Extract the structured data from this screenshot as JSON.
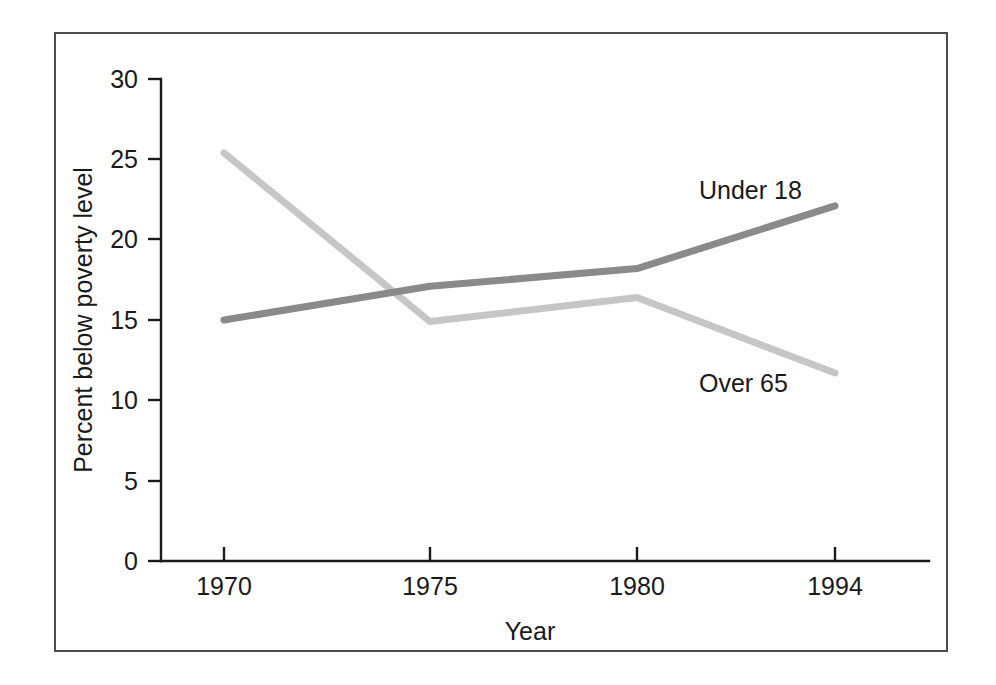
{
  "chart_data": {
    "type": "line",
    "title": "",
    "xlabel": "Year",
    "ylabel": "Percent below poverty level",
    "categories": [
      "1970",
      "1975",
      "1980",
      "1994"
    ],
    "x_tick_labels": [
      "1970",
      "1975",
      "1980",
      "1994"
    ],
    "y_tick_labels": [
      "0",
      "5",
      "10",
      "15",
      "20",
      "25",
      "30"
    ],
    "y_ticks": [
      0,
      5,
      10,
      15,
      20,
      25,
      30
    ],
    "ylim": [
      0,
      30
    ],
    "grid": false,
    "legend_position": "inline-annotations",
    "series": [
      {
        "name": "Under 18",
        "color": "#8a8a8a",
        "values": [
          15.0,
          17.1,
          18.2,
          22.1
        ],
        "label_text": "Under 18"
      },
      {
        "name": "Over 65",
        "color": "#c6c6c6",
        "values": [
          25.4,
          14.9,
          16.4,
          11.7
        ],
        "label_text": "Over 65"
      }
    ],
    "annotations": [
      {
        "text": "Under 18",
        "x": "1984",
        "y": 22.8
      },
      {
        "text": "Over 65",
        "x": "1984",
        "y": 12.4
      }
    ]
  },
  "axis": {
    "y_label": "Percent below poverty level",
    "x_label": "Year",
    "y_ticks": [
      {
        "label": "30",
        "value": 30
      },
      {
        "label": "25",
        "value": 25
      },
      {
        "label": "20",
        "value": 20
      },
      {
        "label": "15",
        "value": 15
      },
      {
        "label": "10",
        "value": 10
      },
      {
        "label": "5",
        "value": 5
      },
      {
        "label": "0",
        "value": 0
      }
    ],
    "x_ticks": [
      {
        "label": "1970"
      },
      {
        "label": "1975"
      },
      {
        "label": "1980"
      },
      {
        "label": "1994"
      }
    ]
  },
  "labels": {
    "series_under_18": "Under 18",
    "series_over_65": "Over 65"
  },
  "colors": {
    "axis": "#1a1a1a",
    "frame": "#4b4b4b",
    "under_18_line": "#8a8a8a",
    "over_65_line": "#c6c6c6",
    "background": "#ffffff"
  }
}
